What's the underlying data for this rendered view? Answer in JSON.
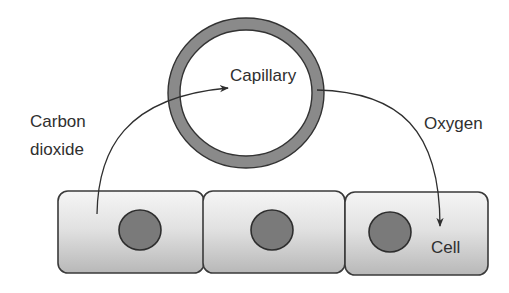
{
  "diagram": {
    "labels": {
      "capillary": "Capillary",
      "carbon_dioxide_line1": "Carbon",
      "carbon_dioxide_line2": "dioxide",
      "oxygen": "Oxygen",
      "cell": "Cell"
    },
    "nodes": [
      {
        "id": "capillary",
        "shape": "ring",
        "label": "Capillary"
      },
      {
        "id": "cell-1",
        "shape": "rounded-rect",
        "label": ""
      },
      {
        "id": "cell-2",
        "shape": "rounded-rect",
        "label": ""
      },
      {
        "id": "cell-3",
        "shape": "rounded-rect",
        "label": "Cell"
      }
    ],
    "edges": [
      {
        "from": "cell-1",
        "to": "capillary",
        "label": "Carbon dioxide"
      },
      {
        "from": "capillary",
        "to": "cell-3",
        "label": "Oxygen"
      }
    ],
    "colors": {
      "ring_fill": "#8a8a8a",
      "outline": "#3a3a3a",
      "nucleus": "#7a7a7a",
      "cell_top": "#f4f4f4",
      "cell_bottom": "#bdbdbd",
      "text": "#2f2f2f"
    }
  }
}
